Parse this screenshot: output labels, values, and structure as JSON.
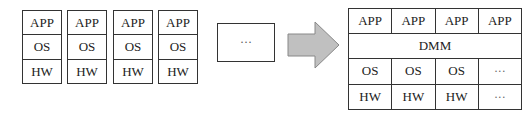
{
  "left": {
    "stacks": [
      {
        "app": "APP",
        "os": "OS",
        "hw": "HW"
      },
      {
        "app": "APP",
        "os": "OS",
        "hw": "HW"
      },
      {
        "app": "APP",
        "os": "OS",
        "hw": "HW"
      },
      {
        "app": "APP",
        "os": "OS",
        "hw": "HW"
      }
    ],
    "more": "···"
  },
  "arrow": {
    "icon": "right-arrow-icon",
    "fill": "#c0c0c0",
    "stroke": "#888888"
  },
  "right": {
    "app_row": [
      "APP",
      "APP",
      "APP",
      "APP"
    ],
    "dmm": "DMM",
    "os_row": [
      "OS",
      "OS",
      "OS",
      "···"
    ],
    "hw_row": [
      "HW",
      "HW",
      "HW",
      "···"
    ]
  }
}
